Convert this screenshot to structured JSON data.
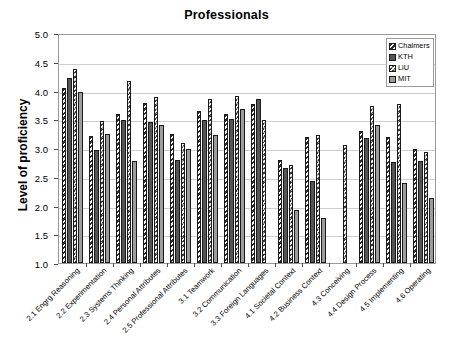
{
  "chart_data": {
    "type": "bar",
    "title": "Professionals",
    "xlabel": "",
    "ylabel": "Level of proficiency",
    "ylim": [
      1.0,
      5.0
    ],
    "ytick_labels": [
      "5.0",
      "4.5",
      "4.0",
      "3.5",
      "3.0",
      "2.5",
      "2.0",
      "1.5",
      "1.0"
    ],
    "yticks": [
      5.0,
      4.5,
      4.0,
      3.5,
      3.0,
      2.5,
      2.0,
      1.5,
      1.0
    ],
    "grid": true,
    "legend_position": "top-right",
    "categories": [
      "2.1 Engrg Reasoning",
      "2.2 Experimentation",
      "2.3 Systems Thinking",
      "2.4 Personal Attributes",
      "2.5 Professional Attributes",
      "3.1 Teamwork",
      "3.2 Communication",
      "3.3 Foreign Languages",
      "4.1 Societal Context",
      "4.2 Business Context",
      "4.3 Conceiving",
      "4.4 Design Process",
      "4.5 Implementing",
      "4.6 Operating"
    ],
    "series": [
      {
        "name": "Chalmers",
        "values": [
          4.05,
          3.21,
          3.6,
          3.79,
          3.25,
          3.65,
          3.6,
          3.76,
          2.8,
          3.2,
          null,
          3.3,
          3.2,
          2.98
        ]
      },
      {
        "name": "KTH",
        "values": [
          4.22,
          2.97,
          3.49,
          3.45,
          2.79,
          3.49,
          3.5,
          3.85,
          2.65,
          2.42,
          null,
          3.17,
          2.75,
          2.78
        ]
      },
      {
        "name": "LiU",
        "values": [
          4.38,
          3.47,
          4.17,
          3.88,
          3.09,
          3.86,
          3.91,
          3.49,
          2.71,
          3.23,
          3.06,
          3.73,
          3.77,
          2.93
        ]
      },
      {
        "name": "MIT",
        "values": [
          3.97,
          3.25,
          2.78,
          3.4,
          2.98,
          3.23,
          3.68,
          null,
          1.93,
          1.79,
          null,
          3.4,
          2.39,
          2.13
        ]
      }
    ],
    "series_colors": [
      "#ffffff",
      "#555555",
      "#3a3a3a",
      "#9d9d9d"
    ]
  },
  "legend": {
    "items": [
      {
        "label": "Chalmers",
        "swatch": "hatch-light"
      },
      {
        "label": "KTH",
        "swatch": "solid-dark-grey"
      },
      {
        "label": "LiU",
        "swatch": "checker-dark"
      },
      {
        "label": "MIT",
        "swatch": "solid-grey"
      }
    ]
  }
}
